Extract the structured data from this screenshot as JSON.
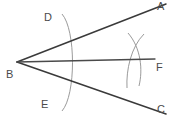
{
  "diagram": {
    "background_color": "#ffffff",
    "stroke_color": "#3a3a3a",
    "arc_color": "#8a8a8a",
    "label_color": "#4a4a4a",
    "vertex_label": "B",
    "labels": {
      "A": "A",
      "B": "B",
      "C": "C",
      "D": "D",
      "E": "E",
      "F": "F"
    },
    "points": {
      "A": {
        "x": 166,
        "y": 5
      },
      "B": {
        "x": 17,
        "y": 62
      },
      "C": {
        "x": 166,
        "y": 113
      },
      "D": {
        "x": 70,
        "y": 36
      },
      "E": {
        "x": 66,
        "y": 94
      },
      "F": {
        "x": 152,
        "y": 61
      }
    },
    "rays": [
      {
        "name": "ray-BA",
        "from": "B",
        "to": "A"
      },
      {
        "name": "ray-BC",
        "from": "B",
        "to": "C"
      },
      {
        "name": "ray-BF",
        "from": "B",
        "to": "F",
        "role": "angle-bisector"
      }
    ],
    "arcs": [
      {
        "name": "arc-DE",
        "center": "B",
        "radius": 57,
        "through": [
          "D",
          "E"
        ]
      },
      {
        "name": "arc-from-D",
        "center": "D",
        "crosses": "arc-from-E"
      },
      {
        "name": "arc-from-E",
        "center": "E",
        "crosses": "arc-from-D"
      }
    ]
  }
}
